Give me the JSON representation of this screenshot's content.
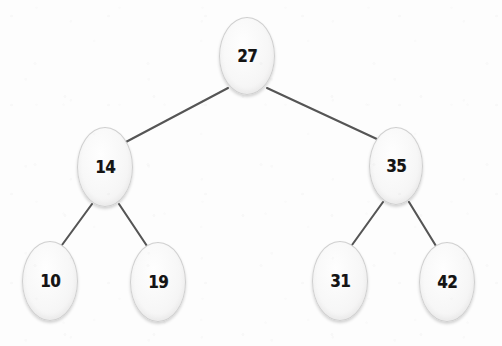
{
  "diagram": {
    "type": "binary-search-tree",
    "canvas": {
      "width": 502,
      "height": 346
    },
    "colors": {
      "background": "#fdfdfd",
      "node_fill": "#f7f7f7",
      "node_stroke": "#cfcfcf",
      "edge_stroke": "#555555",
      "label_color": "#141414"
    },
    "nodes": [
      {
        "id": "n27",
        "label": "27",
        "cx": 247,
        "cy": 56,
        "rx": 28,
        "ry": 39,
        "level": 0,
        "role": "root"
      },
      {
        "id": "n14",
        "label": "14",
        "cx": 105,
        "cy": 167,
        "rx": 28,
        "ry": 40,
        "level": 1,
        "role": "left-child"
      },
      {
        "id": "n35",
        "label": "35",
        "cx": 396,
        "cy": 166,
        "rx": 27,
        "ry": 39,
        "level": 1,
        "role": "right-child"
      },
      {
        "id": "n10",
        "label": "10",
        "cx": 50,
        "cy": 281,
        "rx": 28,
        "ry": 40,
        "level": 2,
        "role": "leaf"
      },
      {
        "id": "n19",
        "label": "19",
        "cx": 158,
        "cy": 282,
        "rx": 28,
        "ry": 40,
        "level": 2,
        "role": "leaf"
      },
      {
        "id": "n31",
        "label": "31",
        "cx": 340,
        "cy": 281,
        "rx": 28,
        "ry": 40,
        "level": 2,
        "role": "leaf"
      },
      {
        "id": "n42",
        "label": "42",
        "cx": 447,
        "cy": 282,
        "rx": 28,
        "ry": 40,
        "level": 2,
        "role": "leaf"
      }
    ],
    "edges": [
      {
        "from": "n27",
        "to": "n14",
        "x1": 228,
        "y1": 88,
        "x2": 124,
        "y2": 143
      },
      {
        "from": "n27",
        "to": "n35",
        "x1": 267,
        "y1": 88,
        "x2": 379,
        "y2": 140
      },
      {
        "from": "n14",
        "to": "n10",
        "x1": 92,
        "y1": 204,
        "x2": 62,
        "y2": 245
      },
      {
        "from": "n14",
        "to": "n19",
        "x1": 119,
        "y1": 204,
        "x2": 147,
        "y2": 246
      },
      {
        "from": "n35",
        "to": "n31",
        "x1": 383,
        "y1": 202,
        "x2": 352,
        "y2": 245
      },
      {
        "from": "n35",
        "to": "n42",
        "x1": 409,
        "y1": 202,
        "x2": 436,
        "y2": 246
      }
    ]
  }
}
